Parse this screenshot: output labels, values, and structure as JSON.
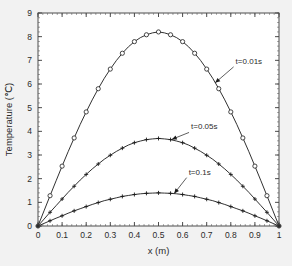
{
  "figure": {
    "background_color": "#f2f2f2",
    "plot_background_color": "#ffffff",
    "frame_color": "#4d4d4d",
    "curve_color": "#1a1a1a"
  },
  "chart_data": {
    "type": "line",
    "title": "",
    "xlabel": "x (m)",
    "ylabel": "Temperature (℃)",
    "xlim": [
      0,
      1
    ],
    "ylim": [
      0,
      9
    ],
    "xticks": [
      0,
      0.1,
      0.2,
      0.3,
      0.4,
      0.5,
      0.6,
      0.7,
      0.8,
      0.9,
      1
    ],
    "xticklabels": [
      "0",
      "0.1",
      "0.2",
      "0.3",
      "0.4",
      "0.5",
      "0.6",
      "0.7",
      "0.8",
      "0.9",
      "1"
    ],
    "yticks": [
      0,
      1,
      2,
      3,
      4,
      5,
      6,
      7,
      8,
      9
    ],
    "yticklabels": [
      "0",
      "1",
      "2",
      "3",
      "4",
      "5",
      "6",
      "7",
      "8",
      "9"
    ],
    "grid": false,
    "legend": "none",
    "x": [
      0,
      0.025,
      0.05,
      0.075,
      0.1,
      0.125,
      0.15,
      0.175,
      0.2,
      0.225,
      0.25,
      0.275,
      0.3,
      0.325,
      0.35,
      0.375,
      0.4,
      0.425,
      0.45,
      0.475,
      0.5,
      0.525,
      0.55,
      0.575,
      0.6,
      0.625,
      0.65,
      0.675,
      0.7,
      0.725,
      0.75,
      0.775,
      0.8,
      0.825,
      0.85,
      0.875,
      0.9,
      0.925,
      0.95,
      0.975,
      1
    ],
    "series": [
      {
        "name": "t=0.01s",
        "peak": 8.2,
        "peak_x": 0.5,
        "marker": "circle",
        "marker_filled": false,
        "values": [
          0,
          0.64,
          1.28,
          1.91,
          2.53,
          3.14,
          3.72,
          4.29,
          4.82,
          5.33,
          5.8,
          6.24,
          6.63,
          6.99,
          7.3,
          7.57,
          7.79,
          7.96,
          8.08,
          8.16,
          8.2,
          8.16,
          8.08,
          7.96,
          7.79,
          7.57,
          7.3,
          6.99,
          6.63,
          6.24,
          5.8,
          5.33,
          4.82,
          4.29,
          3.72,
          3.14,
          2.53,
          1.91,
          1.28,
          0.64,
          0
        ]
      },
      {
        "name": "t=0.05s",
        "peak": 3.7,
        "peak_x": 0.5,
        "marker": "plus",
        "marker_filled": false,
        "values": [
          0,
          0.29,
          0.58,
          0.86,
          1.14,
          1.42,
          1.68,
          1.94,
          2.18,
          2.41,
          2.62,
          2.82,
          2.99,
          3.15,
          3.29,
          3.42,
          3.52,
          3.59,
          3.65,
          3.68,
          3.7,
          3.68,
          3.65,
          3.59,
          3.52,
          3.42,
          3.29,
          3.15,
          2.99,
          2.82,
          2.62,
          2.41,
          2.18,
          1.94,
          1.68,
          1.42,
          1.14,
          0.86,
          0.58,
          0.29,
          0
        ]
      },
      {
        "name": "t=0.1s",
        "peak": 1.4,
        "peak_x": 0.5,
        "marker": "plus",
        "marker_filled": false,
        "values": [
          0,
          0.11,
          0.22,
          0.33,
          0.43,
          0.54,
          0.64,
          0.73,
          0.82,
          0.91,
          0.99,
          1.07,
          1.13,
          1.19,
          1.25,
          1.29,
          1.33,
          1.36,
          1.38,
          1.39,
          1.4,
          1.39,
          1.38,
          1.36,
          1.33,
          1.29,
          1.25,
          1.19,
          1.13,
          1.07,
          0.99,
          0.91,
          0.82,
          0.73,
          0.64,
          0.54,
          0.43,
          0.33,
          0.22,
          0.11,
          0
        ]
      }
    ],
    "annotations": [
      {
        "text": "t=0.01s",
        "label_x": 0.82,
        "label_y": 6.85,
        "point_x": 0.735,
        "point_y": 6.05
      },
      {
        "text": "t=0.05s",
        "label_x": 0.635,
        "label_y": 4.08,
        "point_x": 0.555,
        "point_y": 3.66
      },
      {
        "text": "t=0.1s",
        "label_x": 0.625,
        "label_y": 2.17,
        "point_x": 0.565,
        "point_y": 1.37
      }
    ]
  }
}
